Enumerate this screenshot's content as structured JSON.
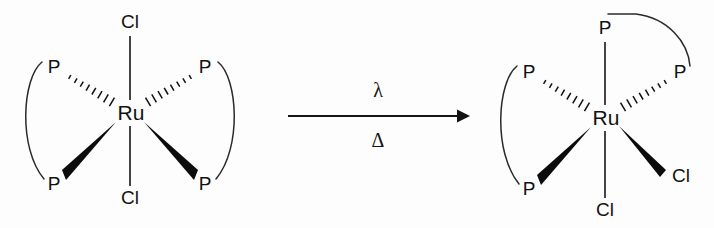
{
  "diagram": {
    "type": "chemical-reaction-scheme",
    "background_color": "#fdfdfd",
    "line_color": "#141414",
    "canvas": {
      "width": 714,
      "height": 228
    }
  },
  "reactant": {
    "name": "trans-dichloro ruthenium bis(diphosphine)",
    "geometry": "octahedral",
    "metal": {
      "symbol": "Ru",
      "x": 130,
      "y": 113
    },
    "substituents": [
      {
        "symbol": "Cl",
        "x": 130,
        "y": 22,
        "bond": "plain",
        "position": "axial-top"
      },
      {
        "symbol": "Cl",
        "x": 130,
        "y": 198,
        "bond": "plain",
        "position": "axial-bottom"
      },
      {
        "symbol": "P",
        "x": 54,
        "y": 67,
        "bond": "hashed",
        "position": "upper-left"
      },
      {
        "symbol": "P",
        "x": 54,
        "y": 184,
        "bond": "wedge",
        "position": "lower-left"
      },
      {
        "symbol": "P",
        "x": 205,
        "y": 67,
        "bond": "hashed",
        "position": "upper-right"
      },
      {
        "symbol": "P",
        "x": 205,
        "y": 184,
        "bond": "wedge",
        "position": "lower-right"
      }
    ],
    "ligand_backbones": [
      {
        "label": "left-diphosphine-chelate",
        "from": "upper-left-P",
        "to": "lower-left-P"
      },
      {
        "label": "right-diphosphine-chelate",
        "from": "upper-right-P",
        "to": "lower-right-P"
      }
    ]
  },
  "arrow": {
    "direction": "left-to-right",
    "x_start": 288,
    "x_end": 470,
    "y": 116,
    "condition_above": "λ",
    "condition_below": "Δ",
    "condition_above_name": "lambda-irradiation",
    "condition_below_name": "delta-heat"
  },
  "product": {
    "name": "cis-dichloro ruthenium bis(diphosphine)",
    "geometry": "octahedral",
    "metal": {
      "symbol": "Ru",
      "x": 605,
      "y": 118
    },
    "substituents": [
      {
        "symbol": "P",
        "x": 605,
        "y": 28,
        "bond": "plain",
        "position": "axial-top"
      },
      {
        "symbol": "Cl",
        "x": 605,
        "y": 210,
        "bond": "plain",
        "position": "axial-bottom"
      },
      {
        "symbol": "P",
        "x": 529,
        "y": 72,
        "bond": "hashed",
        "position": "upper-left"
      },
      {
        "symbol": "P",
        "x": 529,
        "y": 189,
        "bond": "wedge",
        "position": "lower-left"
      },
      {
        "symbol": "P",
        "x": 680,
        "y": 72,
        "bond": "hashed",
        "position": "upper-right"
      },
      {
        "symbol": "Cl",
        "x": 678,
        "y": 176,
        "bond": "wedge",
        "position": "lower-right"
      }
    ],
    "ligand_backbones": [
      {
        "label": "left-diphosphine-chelate",
        "from": "upper-left-P",
        "to": "lower-left-P"
      },
      {
        "label": "right-diphosphine-chelate",
        "from": "axial-top-P",
        "to": "upper-right-P"
      }
    ]
  }
}
